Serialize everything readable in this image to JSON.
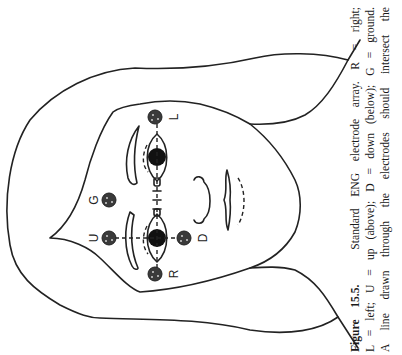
{
  "figure": {
    "title": "Standard ENG electrode array",
    "orientation": "rotated 90deg counter-clockwise",
    "electrodes": [
      {
        "id": "L",
        "label": "L",
        "meaning": "left",
        "x": 155,
        "y": 117
      },
      {
        "id": "R",
        "label": "R",
        "meaning": "right",
        "x": 155,
        "y": 274
      },
      {
        "id": "U",
        "label": "U",
        "meaning": "up (above)",
        "x": 109,
        "y": 238
      },
      {
        "id": "D",
        "label": "D",
        "meaning": "down (below)",
        "x": 184,
        "y": 238
      },
      {
        "id": "G",
        "label": "G",
        "meaning": "ground",
        "x": 109,
        "y": 200
      }
    ],
    "colors": {
      "line": "#222222",
      "background": "#ffffff",
      "electrode_fill": "#3a3a3a"
    }
  },
  "caption": {
    "label": "Figure 15.5.",
    "lines": [
      "Standard ENG electrode array. R = right;",
      "L = left; U = up (above); D = down (below); G = ground.",
      "A line drawn through the electrodes should intersect the"
    ]
  }
}
